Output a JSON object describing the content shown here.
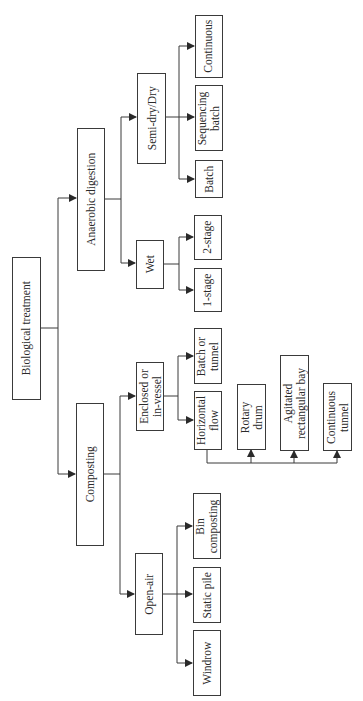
{
  "diagram": {
    "type": "tree",
    "orientation": "rotated-90-ccw",
    "line_color": "#3a3a3a",
    "root": {
      "id": "biological",
      "label": "Biological treatment",
      "children": [
        {
          "id": "anaerobic",
          "label": "Anaerobic digestion",
          "children": [
            {
              "id": "semidry",
              "label": "Semi-dry/Dry",
              "children": [
                {
                  "id": "continuous",
                  "label": "Continuous"
                },
                {
                  "id": "seqbatch",
                  "label": "Sequencing\nbatch"
                },
                {
                  "id": "batch",
                  "label": "Batch"
                }
              ]
            },
            {
              "id": "wet",
              "label": "Wet",
              "children": [
                {
                  "id": "stage2",
                  "label": "2-stage"
                },
                {
                  "id": "stage1",
                  "label": "1-stage"
                }
              ]
            }
          ]
        },
        {
          "id": "composting",
          "label": "Composting",
          "children": [
            {
              "id": "enclosed",
              "label": "Enclosed or\nin-vessel",
              "children": [
                {
                  "id": "batchtunnel",
                  "label": "Batch or\ntunnel"
                },
                {
                  "id": "horizontal",
                  "label": "Horizontal\nflow",
                  "children": [
                    {
                      "id": "rotary",
                      "label": "Rotary\ndrum"
                    },
                    {
                      "id": "agitated",
                      "label": "Agitated\nrectangular bay"
                    },
                    {
                      "id": "conttunnel",
                      "label": "Continuous\ntunnel"
                    }
                  ]
                }
              ]
            },
            {
              "id": "openair",
              "label": "Open-air",
              "children": [
                {
                  "id": "bin",
                  "label": "Bin\ncomposting"
                },
                {
                  "id": "staticpile",
                  "label": "Static pile"
                },
                {
                  "id": "windrow",
                  "label": "Windrow"
                }
              ]
            }
          ]
        }
      ]
    }
  },
  "nodes": {
    "biological": "Biological treatment",
    "anaerobic": "Anaerobic digestion",
    "composting": "Composting",
    "semidry": "Semi-dry/Dry",
    "wet": "Wet",
    "enclosed": "Enclosed or\nin-vessel",
    "openair": "Open-air",
    "continuous": "Continuous",
    "seqbatch": "Sequencing\nbatch",
    "batch": "Batch",
    "stage2": "2-stage",
    "stage1": "1-stage",
    "batchtunnel": "Batch or\ntunnel",
    "horizontal": "Horizontal\nflow",
    "rotary": "Rotary\ndrum",
    "agitated": "Agitated\nrectangular bay",
    "conttunnel": "Continuous\ntunnel",
    "bin": "Bin\ncomposting",
    "staticpile": "Static pile",
    "windrow": "Windrow"
  }
}
